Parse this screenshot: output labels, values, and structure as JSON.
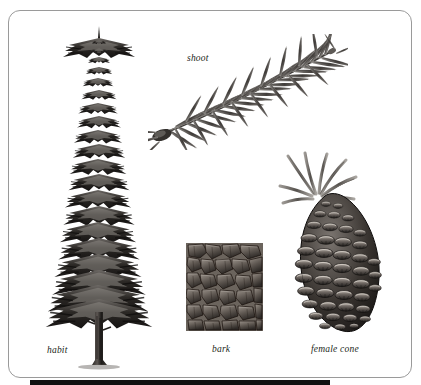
{
  "figure": {
    "background_color": "#ffffff",
    "frame_color": "#9a9a9a",
    "ink_color": "#231f20",
    "bottom_bar_color": "#111111"
  },
  "labels": {
    "habit": "habit",
    "shoot": "shoot",
    "bark": "bark",
    "female_cone": "female cone"
  },
  "panels": [
    {
      "name": "habit",
      "label": "habit",
      "subject": "whole conical spruce tree with layered branch whorls and bare trunk"
    },
    {
      "name": "shoot",
      "label": "shoot",
      "subject": "leafy twig with radiating needles, bud at tip"
    },
    {
      "name": "bark",
      "label": "bark",
      "subject": "rectangular patch of scaly plated bark texture"
    },
    {
      "name": "female-cone",
      "label": "female cone",
      "subject": "elongated pendulous seed cone with overlapping scales and needle sprig"
    }
  ]
}
